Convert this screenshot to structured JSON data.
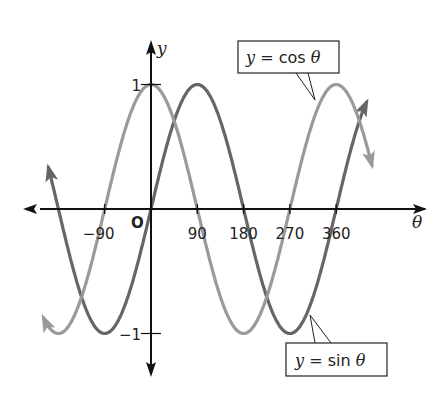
{
  "chart_data": {
    "type": "line",
    "title": "",
    "xlabel": "θ",
    "ylabel": "y",
    "origin_label": "O",
    "x_ticks": [
      -90,
      90,
      180,
      270,
      360
    ],
    "x_tick_labels": [
      "−90",
      "90",
      "180",
      "270",
      "360"
    ],
    "y_ticks": [
      1,
      -1
    ],
    "y_tick_labels": [
      "1",
      "−1"
    ],
    "xlim": [
      -225,
      450
    ],
    "ylim": [
      -1.5,
      1.5
    ],
    "grid": false,
    "series": [
      {
        "name": "y = sin θ",
        "function": "sin",
        "color": "#666666",
        "x": [
          -200,
          -180,
          -90,
          0,
          90,
          180,
          270,
          360,
          420
        ],
        "values": [
          0.34,
          0,
          -1,
          0,
          1,
          0,
          -1,
          0,
          0.87
        ]
      },
      {
        "name": "y = cos θ",
        "function": "cos",
        "color": "#9a9a9a",
        "x": [
          -210,
          -180,
          -90,
          0,
          90,
          180,
          270,
          360,
          430
        ],
        "values": [
          -0.87,
          -1,
          0,
          1,
          0,
          -1,
          0,
          1,
          0.34
        ]
      }
    ],
    "annotations": [
      {
        "text_prefix": "y",
        "text_eq": " = cos ",
        "text_var": "θ",
        "points_to": "y = cos θ",
        "position": "top-right"
      },
      {
        "text_prefix": "y",
        "text_eq": " = sin ",
        "text_var": "θ",
        "points_to": "y = sin θ",
        "position": "bottom-right"
      }
    ]
  }
}
